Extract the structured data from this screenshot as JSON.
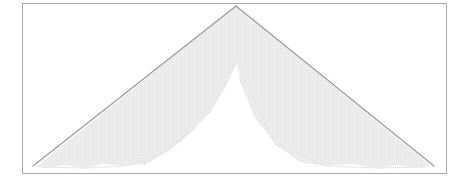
{
  "figure": {
    "canvas": {
      "width": 469,
      "height": 186
    },
    "background_color": "#ffffff",
    "caption": "",
    "frame": {
      "label": "figure border frame",
      "x": 22,
      "y": 3,
      "width": 425,
      "height": 171,
      "stroke_color": "#a9a9a9",
      "stroke_width": 1,
      "fill": "none"
    },
    "shape": {
      "name": "chevron-band",
      "description": "Inverted V (roof / chevron) shaped band with halftone fill, crisp dark upper edge and ragged faded lower edge",
      "apex": {
        "x": 236,
        "y": 6
      },
      "inner_apex": {
        "x": 237,
        "y": 62
      },
      "left_end": {
        "x": 33,
        "y": 166
      },
      "right_end": {
        "x": 434,
        "y": 166
      },
      "band_thickness": 56,
      "fill_color": "#ededed",
      "halftone_dot_color": "#dcdcdc",
      "top_edge_color": "#9a9a9a",
      "top_edge_width": 1.2,
      "bottom_edge_color": "#e6e6e6",
      "outline_path": "M236,6 L434,166 L425,167 L237,62 L42,167 L33,166 Z",
      "fill_path": "M236,6 L431,166 L416,168 L400,166 L378,168 L340,165 L300,163 L260,124 L237,62 L213,110 L170,152 L150,163 L118,167 L92,165 L70,168 L52,166 L36,167 Z"
    },
    "artifacts": [
      {
        "name": "scan-speck",
        "x": 143,
        "y": 162,
        "color": "#e2e2e2"
      }
    ],
    "colors": {
      "background": "#ffffff",
      "frame_line": "#a9a9a9",
      "band_fill": "#ededed",
      "band_edge_dark": "#9a9a9a",
      "band_edge_faint": "#e6e6e6"
    }
  },
  "chart_data": {
    "type": "line",
    "title": "",
    "xlabel": "",
    "ylabel": "",
    "grid": false,
    "legend": null,
    "xlim": [
      22,
      447
    ],
    "ylim": [
      3,
      174
    ],
    "note": "Figure depicts a single chevron (inverted V) band, not a quantitative plot. Vertices given in pixel coordinates with y increasing downward.",
    "series": [
      {
        "name": "band-upper-edge",
        "x": [
          33,
          236,
          434
        ],
        "values": [
          166,
          6,
          166
        ]
      },
      {
        "name": "band-lower-edge",
        "x": [
          42,
          237,
          425
        ],
        "values": [
          167,
          62,
          167
        ]
      }
    ]
  }
}
